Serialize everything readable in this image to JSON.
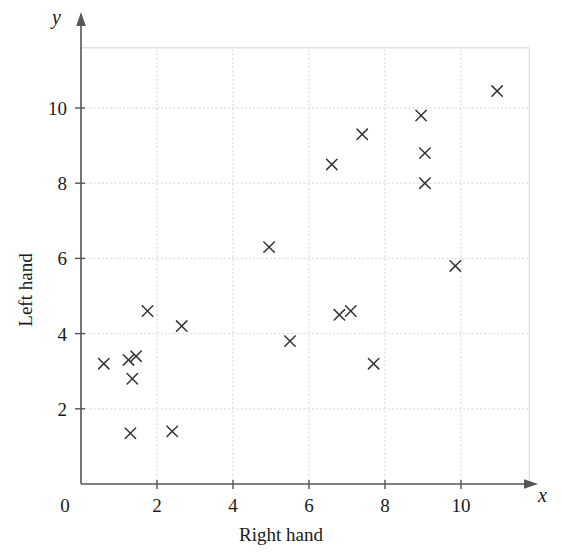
{
  "chart_data": {
    "type": "scatter",
    "title": "",
    "xlabel": "Right hand",
    "ylabel": "Left hand",
    "x_symbol": "x",
    "y_symbol": "y",
    "xlim": [
      0,
      11.8
    ],
    "ylim": [
      0,
      11.6
    ],
    "grid": true,
    "legend": "none",
    "xticks": [
      0,
      2,
      4,
      6,
      8,
      10
    ],
    "yticks": [
      0,
      2,
      4,
      6,
      8,
      10
    ],
    "xtick_labels": [
      "0",
      "2",
      "4",
      "6",
      "8",
      "10"
    ],
    "ytick_labels": [
      "0",
      "2",
      "4",
      "6",
      "8",
      "10"
    ],
    "marker": "x",
    "marker_color": "#33333a",
    "grid_color": "#c8c8cf",
    "axis_color": "#55555a",
    "points": [
      {
        "x": 0.6,
        "y": 3.2
      },
      {
        "x": 1.25,
        "y": 3.3
      },
      {
        "x": 1.45,
        "y": 3.4
      },
      {
        "x": 1.35,
        "y": 2.8
      },
      {
        "x": 1.3,
        "y": 1.35
      },
      {
        "x": 1.75,
        "y": 4.6
      },
      {
        "x": 2.4,
        "y": 1.4
      },
      {
        "x": 2.65,
        "y": 4.2
      },
      {
        "x": 4.95,
        "y": 6.3
      },
      {
        "x": 5.5,
        "y": 3.8
      },
      {
        "x": 6.6,
        "y": 8.5
      },
      {
        "x": 6.8,
        "y": 4.5
      },
      {
        "x": 7.1,
        "y": 4.6
      },
      {
        "x": 7.4,
        "y": 9.3
      },
      {
        "x": 7.7,
        "y": 3.2
      },
      {
        "x": 8.95,
        "y": 9.8
      },
      {
        "x": 9.05,
        "y": 8.8
      },
      {
        "x": 9.05,
        "y": 8.0
      },
      {
        "x": 9.85,
        "y": 5.8
      },
      {
        "x": 10.95,
        "y": 10.45
      }
    ]
  }
}
